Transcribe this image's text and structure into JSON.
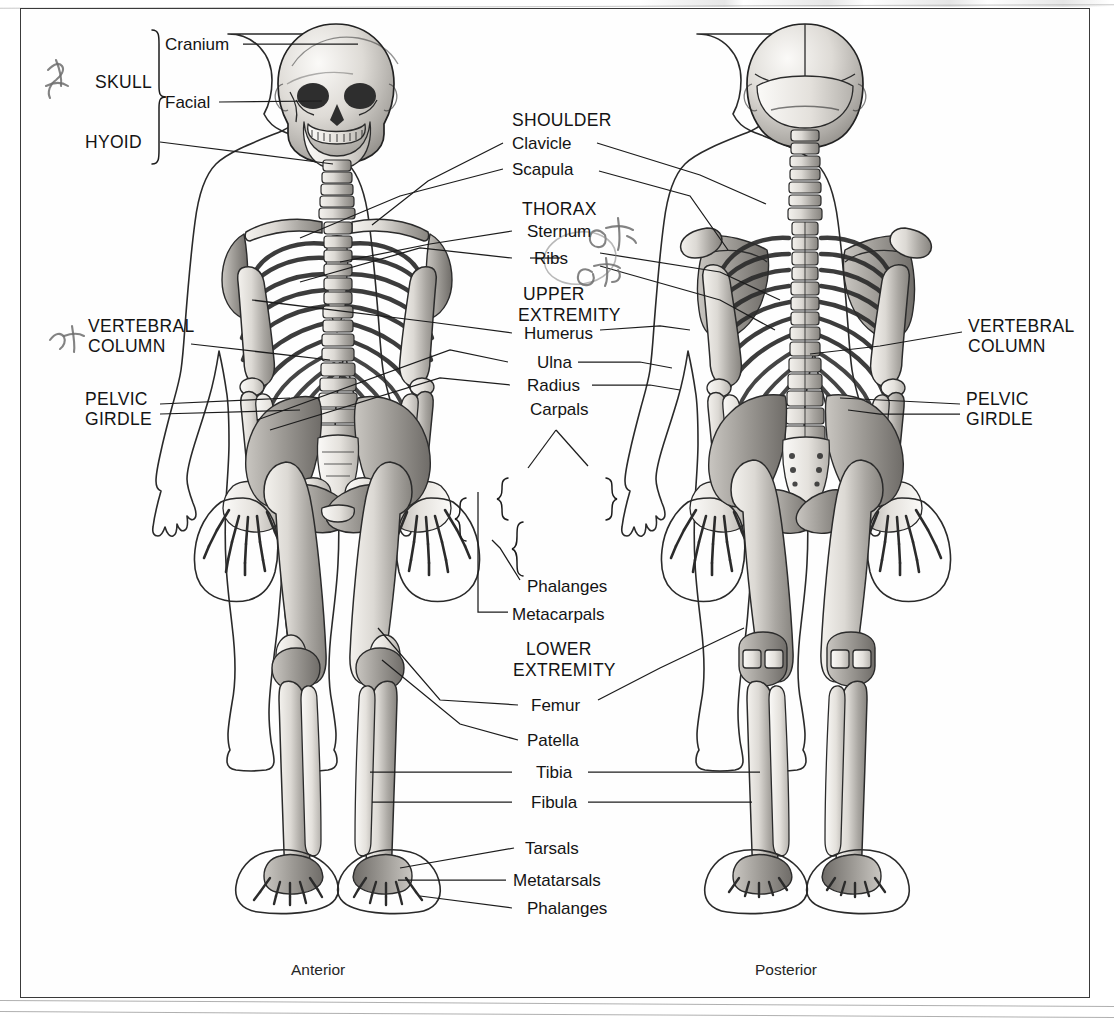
{
  "figure": {
    "title_caption_left": "Anterior",
    "title_caption_right": "Posterior"
  },
  "labels": {
    "skull_group": "SKULL",
    "cranium": "Cranium",
    "facial": "Facial",
    "hyoid": "HYOID",
    "shoulder_group": "SHOULDER",
    "clavicle": "Clavicle",
    "scapula": "Scapula",
    "thorax_group": "THORAX",
    "sternum": "Sternum",
    "ribs": "Ribs",
    "upper_extremity_line1": "UPPER",
    "upper_extremity_line2": "EXTREMITY",
    "humerus": "Humerus",
    "ulna": "Ulna",
    "radius": "Radius",
    "carpals": "Carpals",
    "phalanges_hand": "Phalanges",
    "metacarpals": "Metacarpals",
    "lower_extremity_line1": "LOWER",
    "lower_extremity_line2": "EXTREMITY",
    "femur": "Femur",
    "patella": "Patella",
    "tibia": "Tibia",
    "fibula": "Fibula",
    "tarsals": "Tarsals",
    "metatarsals": "Metatarsals",
    "phalanges_foot": "Phalanges",
    "vertebral_column_left_line1": "VERTEBRAL",
    "vertebral_column_left_line2": "COLUMN",
    "pelvic_girdle_left_line1": "PELVIC",
    "pelvic_girdle_left_line2": "GIRDLE",
    "vertebral_column_right_line1": "VERTEBRAL",
    "vertebral_column_right_line2": "COLUMN",
    "pelvic_girdle_right_line1": "PELVIC",
    "pelvic_girdle_right_line2": "GIRDLE"
  },
  "annotations": {
    "handwritten_marks_count": 4,
    "note": "handwritten ink check-marks near SKULL, VERTEBRAL COLUMN, Sternum and Ribs"
  },
  "colors": {
    "background": "#ffffff",
    "frame_border": "#3a3a3a",
    "label_text": "#141414",
    "leader_line": "#1c1c1c",
    "bone_fill_light": "#f2f0ec",
    "bone_fill_mid": "#c9c6c1",
    "bone_fill_dark": "#8e8b87",
    "handwriting_ink": "#6d6d6d"
  }
}
